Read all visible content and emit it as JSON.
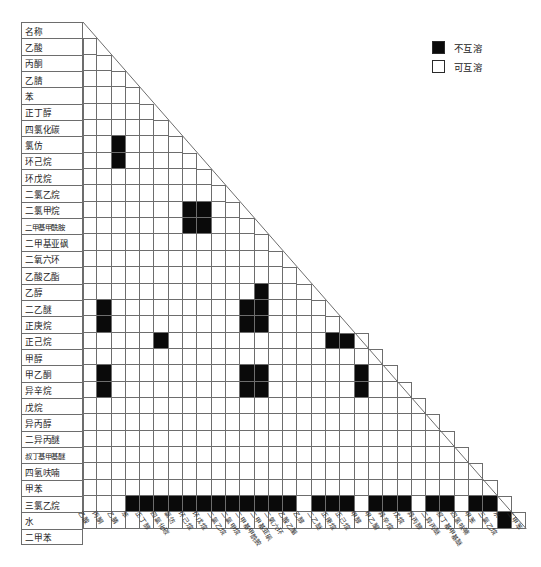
{
  "header_label": "名称",
  "legend": {
    "items": [
      {
        "name": "immiscible",
        "label": "不互溶",
        "color": "#0a0a0a"
      },
      {
        "name": "miscible",
        "label": "可互溶",
        "color": "#ffffff"
      }
    ]
  },
  "chart_data": {
    "type": "heatmap",
    "title": "",
    "xlabel": "",
    "ylabel": "",
    "legend_position": "top-right",
    "grid": true,
    "value_meaning": {
      "1": "不互溶",
      "0": "可互溶"
    },
    "colors": {
      "immiscible": "#0a0a0a",
      "miscible": "#ffffff",
      "grid": "#6d6d6d"
    },
    "categories": [
      "乙酸",
      "丙酮",
      "乙腈",
      "苯",
      "正丁醇",
      "四氯化碳",
      "氯仿",
      "环己烷",
      "环戊烷",
      "二氯乙烷",
      "二氯甲烷",
      "二甲基甲酰胺",
      "二甲基亚砜",
      "二氧六环",
      "乙酸乙酯",
      "乙醇",
      "二乙醚",
      "正庚烷",
      "正己烷",
      "甲醇",
      "甲乙酮",
      "异辛烷",
      "戊烷",
      "异丙醇",
      "二异丙醚",
      "叔丁基甲基醚",
      "四氢呋喃",
      "甲苯",
      "三氯乙烷",
      "水",
      "二甲苯"
    ],
    "rows": [
      {
        "name": "乙酸",
        "values": []
      },
      {
        "name": "丙酮",
        "values": [
          0
        ]
      },
      {
        "name": "乙腈",
        "values": [
          0,
          0
        ]
      },
      {
        "name": "苯",
        "values": [
          0,
          0,
          0
        ]
      },
      {
        "name": "正丁醇",
        "values": [
          0,
          0,
          0,
          0
        ]
      },
      {
        "name": "四氯化碳",
        "values": [
          0,
          0,
          0,
          0,
          0
        ]
      },
      {
        "name": "氯仿",
        "values": [
          0,
          0,
          0,
          0,
          0,
          0
        ]
      },
      {
        "name": "环己烷",
        "values": [
          0,
          0,
          1,
          0,
          0,
          0,
          0
        ]
      },
      {
        "name": "环戊烷",
        "values": [
          0,
          0,
          1,
          0,
          0,
          0,
          0,
          0
        ]
      },
      {
        "name": "二氯乙烷",
        "values": [
          0,
          0,
          0,
          0,
          0,
          0,
          0,
          0,
          0
        ]
      },
      {
        "name": "二氯甲烷",
        "values": [
          0,
          0,
          0,
          0,
          0,
          0,
          0,
          0,
          0,
          0
        ]
      },
      {
        "name": "二甲基甲酰胺",
        "values": [
          0,
          0,
          0,
          0,
          0,
          0,
          0,
          1,
          1,
          0,
          0
        ]
      },
      {
        "name": "二甲基亚砜",
        "values": [
          0,
          0,
          0,
          0,
          0,
          0,
          0,
          1,
          1,
          0,
          0,
          0
        ]
      },
      {
        "name": "二氧六环",
        "values": [
          0,
          0,
          0,
          0,
          0,
          0,
          0,
          0,
          0,
          0,
          0,
          0,
          0
        ]
      },
      {
        "name": "乙酸乙酯",
        "values": [
          0,
          0,
          0,
          0,
          0,
          0,
          0,
          0,
          0,
          0,
          0,
          0,
          0,
          0
        ]
      },
      {
        "name": "乙醇",
        "values": [
          0,
          0,
          0,
          0,
          0,
          0,
          0,
          0,
          0,
          0,
          0,
          0,
          0,
          0,
          0
        ]
      },
      {
        "name": "二乙醚",
        "values": [
          0,
          0,
          0,
          0,
          0,
          0,
          0,
          0,
          0,
          0,
          0,
          0,
          1,
          0,
          0,
          0
        ]
      },
      {
        "name": "正庚烷",
        "values": [
          0,
          1,
          0,
          0,
          0,
          0,
          0,
          0,
          0,
          0,
          0,
          1,
          1,
          0,
          0,
          0,
          0
        ]
      },
      {
        "name": "正己烷",
        "values": [
          0,
          1,
          0,
          0,
          0,
          0,
          0,
          0,
          0,
          0,
          0,
          1,
          1,
          0,
          0,
          0,
          0,
          0
        ]
      },
      {
        "name": "甲醇",
        "values": [
          0,
          0,
          0,
          0,
          0,
          1,
          0,
          0,
          0,
          0,
          0,
          0,
          0,
          0,
          0,
          0,
          0,
          1,
          1,
          0
        ]
      },
      {
        "name": "甲乙酮",
        "values": [
          0,
          0,
          0,
          0,
          0,
          0,
          0,
          0,
          0,
          0,
          0,
          0,
          0,
          0,
          0,
          0,
          0,
          0,
          0,
          0,
          0
        ]
      },
      {
        "name": "异辛烷",
        "values": [
          0,
          1,
          0,
          0,
          0,
          0,
          0,
          0,
          0,
          0,
          0,
          1,
          1,
          0,
          0,
          0,
          0,
          0,
          0,
          1,
          0,
          0
        ]
      },
      {
        "name": "戊烷",
        "values": [
          0,
          1,
          0,
          0,
          0,
          0,
          0,
          0,
          0,
          0,
          0,
          1,
          1,
          0,
          0,
          0,
          0,
          0,
          0,
          1,
          0,
          0,
          0
        ]
      },
      {
        "name": "异丙醇",
        "values": [
          0,
          0,
          0,
          0,
          0,
          0,
          0,
          0,
          0,
          0,
          0,
          0,
          0,
          0,
          0,
          0,
          0,
          0,
          0,
          0,
          0,
          0,
          0,
          0
        ]
      },
      {
        "name": "二异丙醚",
        "values": [
          0,
          0,
          0,
          0,
          0,
          0,
          0,
          0,
          0,
          0,
          0,
          0,
          0,
          0,
          0,
          0,
          0,
          0,
          0,
          0,
          0,
          0,
          0,
          0,
          0
        ]
      },
      {
        "name": "叔丁基甲基醚",
        "values": [
          0,
          0,
          0,
          0,
          0,
          0,
          0,
          0,
          0,
          0,
          0,
          0,
          0,
          0,
          0,
          0,
          0,
          0,
          0,
          0,
          0,
          0,
          0,
          0,
          0,
          0
        ]
      },
      {
        "name": "四氢呋喃",
        "values": [
          0,
          0,
          0,
          0,
          0,
          0,
          0,
          0,
          0,
          0,
          0,
          0,
          0,
          0,
          0,
          0,
          0,
          0,
          0,
          0,
          0,
          0,
          0,
          0,
          0,
          0,
          0
        ]
      },
      {
        "name": "甲苯",
        "values": [
          0,
          0,
          0,
          0,
          0,
          0,
          0,
          0,
          0,
          0,
          0,
          0,
          0,
          0,
          0,
          0,
          0,
          0,
          0,
          0,
          0,
          0,
          0,
          0,
          0,
          0,
          0,
          0
        ]
      },
      {
        "name": "三氯乙烷",
        "values": [
          0,
          0,
          0,
          0,
          0,
          0,
          0,
          0,
          0,
          0,
          0,
          0,
          0,
          0,
          0,
          0,
          0,
          0,
          0,
          0,
          0,
          0,
          0,
          0,
          0,
          0,
          0,
          0,
          0
        ]
      },
      {
        "name": "水",
        "values": [
          0,
          0,
          0,
          1,
          1,
          1,
          1,
          1,
          1,
          1,
          1,
          1,
          1,
          1,
          1,
          0,
          1,
          1,
          1,
          0,
          1,
          1,
          1,
          0,
          1,
          1,
          0,
          1,
          1,
          0
        ]
      },
      {
        "name": "二甲苯",
        "values": [
          0,
          0,
          0,
          0,
          0,
          0,
          0,
          0,
          0,
          0,
          0,
          0,
          0,
          0,
          0,
          0,
          0,
          0,
          0,
          0,
          0,
          0,
          0,
          0,
          0,
          0,
          0,
          0,
          0,
          1,
          0
        ]
      }
    ]
  }
}
